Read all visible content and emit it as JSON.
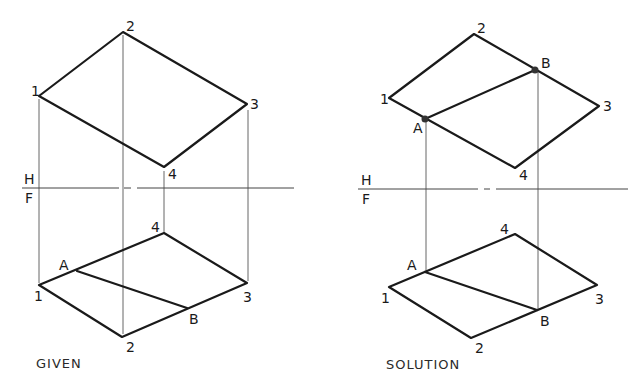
{
  "panels": {
    "given": {
      "caption": "GIVEN",
      "fold_labels": {
        "top": "H",
        "bottom": "F"
      },
      "top_view": {
        "vertices": [
          {
            "label": "1",
            "x": 39,
            "y": 96
          },
          {
            "label": "2",
            "x": 123,
            "y": 32
          },
          {
            "label": "3",
            "x": 247,
            "y": 104
          },
          {
            "label": "4",
            "x": 164,
            "y": 167
          }
        ]
      },
      "front_view": {
        "vertices": [
          {
            "label": "1",
            "x": 39,
            "y": 285
          },
          {
            "label": "4",
            "x": 164,
            "y": 233
          },
          {
            "label": "3",
            "x": 247,
            "y": 283
          },
          {
            "label": "2",
            "x": 122,
            "y": 337
          }
        ],
        "line": [
          {
            "label": "A",
            "x": 77,
            "y": 271
          },
          {
            "label": "B",
            "x": 187,
            "y": 308
          }
        ]
      }
    },
    "solution": {
      "caption": "SOLUTION",
      "fold_labels": {
        "top": "H",
        "bottom": "F"
      },
      "top_view": {
        "vertices": [
          {
            "label": "1",
            "x": 389,
            "y": 98
          },
          {
            "label": "2",
            "x": 474,
            "y": 34
          },
          {
            "label": "3",
            "x": 599,
            "y": 106
          },
          {
            "label": "4",
            "x": 515,
            "y": 168
          }
        ],
        "line": [
          {
            "label": "A",
            "x": 425,
            "y": 119
          },
          {
            "label": "B",
            "x": 535,
            "y": 70
          }
        ]
      },
      "front_view": {
        "vertices": [
          {
            "label": "1",
            "x": 389,
            "y": 287
          },
          {
            "label": "4",
            "x": 515,
            "y": 234
          },
          {
            "label": "3",
            "x": 597,
            "y": 285
          },
          {
            "label": "2",
            "x": 471,
            "y": 338
          }
        ],
        "line": [
          {
            "label": "A",
            "x": 425,
            "y": 272
          },
          {
            "label": "B",
            "x": 537,
            "y": 310
          }
        ]
      }
    }
  },
  "colors": {
    "line": "#1a1a1a",
    "projector": "#555555",
    "background": "#ffffff"
  }
}
